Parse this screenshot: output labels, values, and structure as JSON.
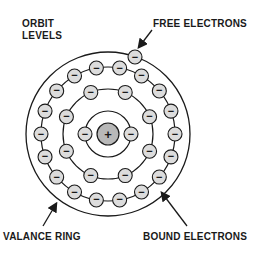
{
  "labels": {
    "orbit_levels_line1": "ORBIT",
    "orbit_levels_line2": "LEVELS",
    "free_electrons": "FREE ELECTRONS",
    "valance_ring": "VALANCE RING",
    "bound_electrons": "BOUND ELECTRONS"
  },
  "symbols": {
    "nucleus": "+",
    "electron": "−"
  },
  "colors": {
    "electron_fill": "#dcdcdc",
    "nucleus_fill": "#b8b8b8",
    "stroke": "#1a1a1a"
  },
  "atom": {
    "center": [
      108,
      134
    ],
    "nucleus_radius": 11,
    "rings": [
      {
        "name": "shell-1",
        "radius": 23,
        "electrons": 2
      },
      {
        "name": "shell-2",
        "radius": 45,
        "electrons": 8
      },
      {
        "name": "shell-3",
        "radius": 67,
        "electrons": 18
      }
    ],
    "valance_ring_radius": 82,
    "free_electron": [
      135,
      57
    ]
  }
}
